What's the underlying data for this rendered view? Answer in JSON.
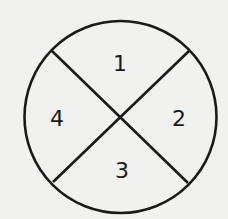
{
  "diagram": {
    "shape": "circle divided into four quadrants by two diagonal lines",
    "colors": {
      "background": "#f1f1f0",
      "stroke": "#1a1a1a"
    },
    "sections": [
      {
        "label": "1",
        "position": "top"
      },
      {
        "label": "2",
        "position": "right"
      },
      {
        "label": "3",
        "position": "bottom"
      },
      {
        "label": "4",
        "position": "left"
      }
    ]
  }
}
